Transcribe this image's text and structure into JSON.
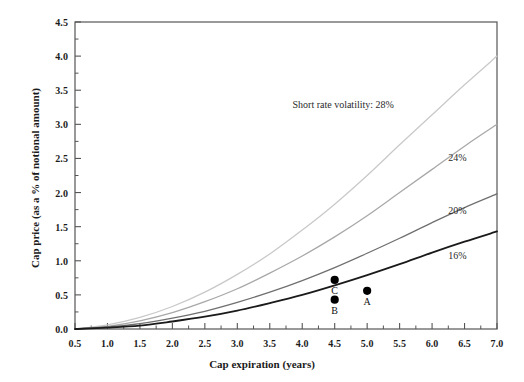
{
  "chart_data": {
    "type": "line",
    "title": "",
    "xlabel": "Cap expiration (years)",
    "ylabel": "Cap price (as a % of notional amount)",
    "xlim": [
      0.5,
      7.0
    ],
    "ylim": [
      0.0,
      4.5
    ],
    "grid": false,
    "legend_position": "inline-annotations",
    "xticks": [
      "0.5",
      "1.0",
      "1.5",
      "2.0",
      "2.5",
      "3.0",
      "3.5",
      "4.0",
      "4.5",
      "5.0",
      "5.5",
      "6.0",
      "6.5",
      "7.0"
    ],
    "xtick_values": [
      0.5,
      1.0,
      1.5,
      2.0,
      2.5,
      3.0,
      3.5,
      4.0,
      4.5,
      5.0,
      5.5,
      6.0,
      6.5,
      7.0
    ],
    "yticks": [
      "0.0",
      "0.5",
      "1.0",
      "1.5",
      "2.0",
      "2.5",
      "3.0",
      "3.5",
      "4.0",
      "4.5"
    ],
    "ytick_values": [
      0.0,
      0.5,
      1.0,
      1.5,
      2.0,
      2.5,
      3.0,
      3.5,
      4.0,
      4.5
    ],
    "x": [
      0.5,
      1.0,
      1.5,
      2.0,
      2.5,
      3.0,
      3.5,
      4.0,
      4.5,
      5.0,
      5.5,
      6.0,
      6.5,
      7.0
    ],
    "series": [
      {
        "name": "28%",
        "label": "Short rate volatility: 28%",
        "color": "#c9c9c9",
        "values": [
          0.0,
          0.06,
          0.17,
          0.33,
          0.54,
          0.8,
          1.1,
          1.45,
          1.83,
          2.25,
          2.7,
          3.14,
          3.58,
          4.0
        ]
      },
      {
        "name": "24%",
        "label": "24%",
        "color": "#a8a8a8",
        "values": [
          0.0,
          0.04,
          0.12,
          0.24,
          0.4,
          0.59,
          0.82,
          1.07,
          1.35,
          1.66,
          2.0,
          2.34,
          2.68,
          3.0
        ]
      },
      {
        "name": "20%",
        "label": "20%",
        "color": "#6f6f6f",
        "values": [
          0.0,
          0.03,
          0.08,
          0.16,
          0.26,
          0.39,
          0.54,
          0.71,
          0.9,
          1.11,
          1.33,
          1.56,
          1.78,
          1.98
        ]
      },
      {
        "name": "16%",
        "label": "16%",
        "color": "#1a1a1a",
        "values": [
          0.0,
          0.02,
          0.05,
          0.11,
          0.18,
          0.27,
          0.38,
          0.5,
          0.64,
          0.79,
          0.95,
          1.12,
          1.28,
          1.43
        ]
      }
    ],
    "annotations": [
      {
        "text": "Short rate volatility: 28%",
        "x": 3.85,
        "y": 3.27,
        "series": "28%"
      },
      {
        "text": "24%",
        "x": 6.25,
        "y": 2.49,
        "series": "24%"
      },
      {
        "text": "20%",
        "x": 6.25,
        "y": 1.72,
        "series": "20%"
      },
      {
        "text": "16%",
        "x": 6.25,
        "y": 1.06,
        "series": "16%"
      }
    ],
    "points": [
      {
        "label": "A",
        "x": 5.0,
        "y": 0.56,
        "series": "16%",
        "label_offset": "below"
      },
      {
        "label": "B",
        "x": 4.5,
        "y": 0.43,
        "series": "16%",
        "label_offset": "below"
      },
      {
        "label": "C",
        "x": 4.5,
        "y": 0.72,
        "series": "20%",
        "label_offset": "below"
      }
    ]
  },
  "axes": {
    "x_title": "Cap expiration (years)",
    "y_title": "Cap price (as a % of notional amount)"
  },
  "colors": {
    "background": "#ffffff",
    "axis": "#555555",
    "text": "#1b1b1b",
    "marker": "#000000"
  }
}
